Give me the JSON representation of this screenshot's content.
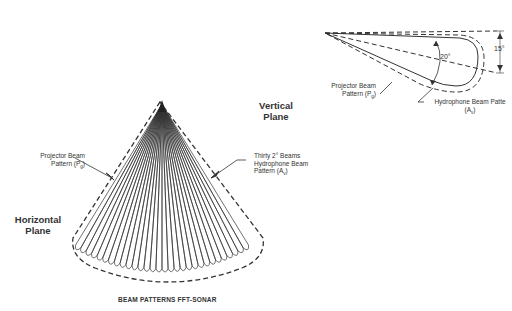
{
  "title": "BEAM PATTERNS FFT-SONAR",
  "horizontal_view": {
    "plane_label_line1": "Horizontal",
    "plane_label_line2": "Plane",
    "projector_label_line1": "Projector Beam",
    "projector_label_line2": "Pattern (P",
    "projector_label_sub": "g",
    "hydrophone_label_line1": "Thirty 2° Beams",
    "hydrophone_label_line2": "Hydrophone Beam",
    "hydrophone_label_line3": "Pattern (A",
    "hydrophone_label_sub": "v",
    "beam_count": 30,
    "beam_width_deg": 2
  },
  "vertical_view": {
    "plane_label_line1": "Vertical",
    "plane_label_line2": "Plane",
    "angle_inner": "20°",
    "angle_outer": "15°",
    "projector_label_line1": "Projector Beam",
    "projector_label_line2": "Pattern (P",
    "projector_label_sub": "g",
    "hydrophone_label_line1": "Hydrophone Beam Patte",
    "hydrophone_label_line2": "(A",
    "hydrophone_label_sub": "v"
  },
  "colors": {
    "line": "#333333",
    "background": "#ffffff"
  }
}
